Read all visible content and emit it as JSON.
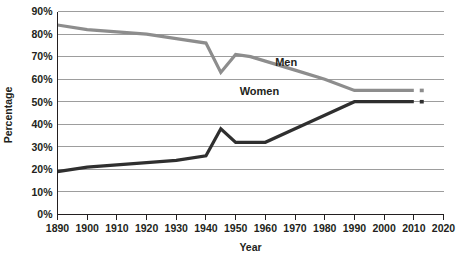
{
  "chart_data": {
    "type": "line",
    "title": "",
    "xlabel": "Year",
    "ylabel": "Percentage",
    "xlim": [
      1890,
      2020
    ],
    "ylim": [
      0,
      90
    ],
    "grid": true,
    "legend_position": "inline-labels",
    "xticks": [
      "1890",
      "1900",
      "1910",
      "1920",
      "1930",
      "1940",
      "1950",
      "1960",
      "1970",
      "1980",
      "1990",
      "2000",
      "2010",
      "2020"
    ],
    "yticks": [
      "0%",
      "10%",
      "20%",
      "30%",
      "40%",
      "50%",
      "60%",
      "70%",
      "80%",
      "90%"
    ],
    "series": [
      {
        "name": "Men",
        "color": "#8d8d8d",
        "label_x": 1967,
        "label_y": 66,
        "x": [
          1890,
          1900,
          1910,
          1920,
          1930,
          1940,
          1945,
          1950,
          1955,
          1960,
          1970,
          1980,
          1990,
          2000,
          2010
        ],
        "values": [
          84,
          82,
          81,
          80,
          78,
          76,
          63,
          71,
          70,
          68,
          64,
          60,
          55,
          55,
          55
        ],
        "projection_x": [
          2012,
          2015
        ],
        "projection_values": [
          55,
          55
        ]
      },
      {
        "name": "Women",
        "color": "#2f2f2f",
        "label_x": 1958,
        "label_y": 53,
        "x": [
          1890,
          1900,
          1910,
          1920,
          1930,
          1940,
          1945,
          1950,
          1955,
          1960,
          1970,
          1980,
          1990,
          2000,
          2010
        ],
        "values": [
          19,
          21,
          22,
          23,
          24,
          26,
          38,
          32,
          32,
          32,
          38,
          44,
          50,
          50,
          50
        ],
        "projection_x": [
          2012,
          2015
        ],
        "projection_values": [
          50,
          50
        ]
      }
    ]
  }
}
